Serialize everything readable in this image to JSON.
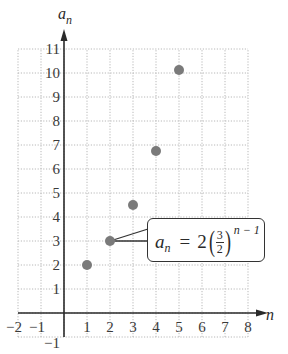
{
  "chart_data": {
    "type": "scatter",
    "title": "",
    "xlabel": "n",
    "ylabel": "a_n",
    "x_ticks": [
      "-2",
      "-1",
      "1",
      "2",
      "3",
      "4",
      "5",
      "6",
      "7",
      "8"
    ],
    "y_ticks": [
      "-1",
      "1",
      "2",
      "3",
      "4",
      "5",
      "6",
      "7",
      "8",
      "9",
      "10",
      "11"
    ],
    "xlim": [
      -2,
      8
    ],
    "ylim": [
      -1,
      11
    ],
    "grid": true,
    "grid_style": "dotted",
    "series": [
      {
        "name": "a_n = 2(3/2)^(n-1)",
        "x": [
          1,
          2,
          3,
          4,
          5
        ],
        "values": [
          2,
          3,
          4.5,
          6.75,
          10.125
        ]
      }
    ],
    "annotations": [
      {
        "text": "a_n = 2(3/2)^(n − 1)",
        "points_to": [
          2,
          3
        ]
      }
    ],
    "point_color": "#7a7a7a",
    "axis_color": "#2a2a2a",
    "grid_color": "#b8b8b8"
  },
  "labels": {
    "x_axis": "n",
    "y_axis_main": "a",
    "y_axis_sub": "n"
  },
  "formula": {
    "lhs": "a",
    "lhs_sub": "n",
    "equals": "=",
    "coef": "2",
    "frac_num": "3",
    "frac_den": "2",
    "exponent": "n − 1"
  }
}
